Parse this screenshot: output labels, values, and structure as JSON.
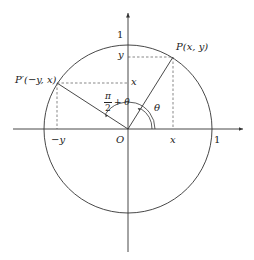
{
  "diagram": {
    "type": "unit-circle-rotation",
    "colors": {
      "stroke": "#333333",
      "dashed": "#555555",
      "text": "#222222",
      "background": "#ffffff"
    },
    "labels": {
      "origin": "O",
      "axis_one_x": "1",
      "axis_one_y": "1",
      "point_p": "P(x, y)",
      "point_p_prime": "P′(−y, x)",
      "y_tick_y": "y",
      "y_tick_x": "x",
      "x_tick_x": "x",
      "x_tick_neg_y": "−y",
      "angle_theta": "θ",
      "angle_sum_num": "π",
      "angle_sum_den": "2",
      "angle_sum_rest": "+ θ"
    }
  }
}
